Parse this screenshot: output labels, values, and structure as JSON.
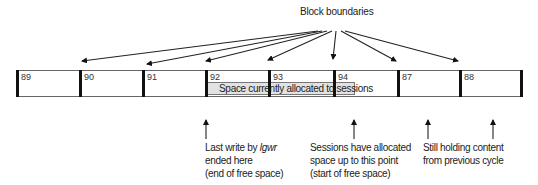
{
  "title": "Block boundaries",
  "blocks": [
    {
      "label": "89",
      "x": 16,
      "w": 63
    },
    {
      "label": "90",
      "x": 79,
      "w": 63
    },
    {
      "label": "91",
      "x": 142,
      "w": 63
    },
    {
      "label": "92",
      "x": 205,
      "w": 63
    },
    {
      "label": "93",
      "x": 268,
      "w": 65
    },
    {
      "label": "94",
      "x": 333,
      "w": 64
    },
    {
      "label": "87",
      "x": 397,
      "w": 62
    },
    {
      "label": "88",
      "x": 459,
      "w": 64
    }
  ],
  "allocated_region": {
    "label": "Space currently allocated to sessions",
    "x_start": 207,
    "x_end": 355,
    "color": "#e2e2e2"
  },
  "annotations": [
    {
      "arrow_x": 206,
      "lines": [
        "Last write by ",
        "lgwr",
        "ended here",
        "(end of free space)"
      ]
    },
    {
      "arrow_x": 354,
      "lines": [
        "Sessions have allocated",
        "space up to this point",
        "(start of free space)"
      ]
    },
    {
      "arrow_x": [
        428,
        493
      ],
      "lines": [
        "Still holding content",
        "from previous cycle"
      ]
    }
  ]
}
